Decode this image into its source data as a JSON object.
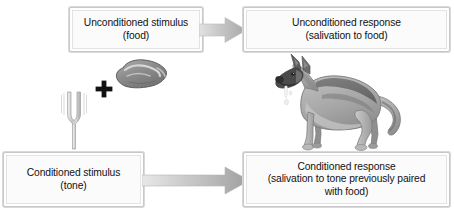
{
  "diagram": {
    "colors": {
      "box_fill": "#fbfbfb",
      "box_border": "#c8c8c8",
      "arrow_fill": "#b4b4b4",
      "text": "#121212",
      "plus": "#121212",
      "fork": "#cfcfcf",
      "meat": "#8f8f8f",
      "dog_light": "#b5b5b5",
      "dog_dark": "#6e6e6e"
    }
  },
  "boxes": {
    "unconditioned_stimulus": {
      "line1": "Unconditioned stimulus",
      "line2": "(food)"
    },
    "unconditioned_response": {
      "line1": "Unconditioned response",
      "line2": "(salivation to food)"
    },
    "conditioned_stimulus": {
      "line1": "Conditioned stimulus",
      "line2": "(tone)"
    },
    "conditioned_response": {
      "line1": "Conditioned response",
      "line2": "(salivation to tone previously paired",
      "line3": "with food)"
    }
  },
  "arrows": {
    "top": "arrow-right-icon",
    "bottom": "arrow-right-long-icon"
  },
  "graphics": {
    "plus": "plus-sign-icon",
    "tuning_fork": "tuning-fork-icon",
    "meat": "meat-food-icon",
    "dog": "dog-salivating-icon"
  }
}
